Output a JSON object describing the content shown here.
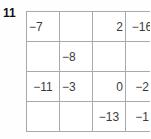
{
  "problem": {
    "number": "11"
  },
  "colors": {
    "grid_line": "#a9a9a9",
    "cell_text": "#3b3b3b",
    "label_text": "#111111",
    "background": "#fefefe"
  },
  "grid": {
    "rows": 4,
    "cols": 4,
    "cells": [
      [
        {
          "value": "−7",
          "align": "left",
          "blank": false
        },
        {
          "value": "",
          "align": "left",
          "blank": true
        },
        {
          "value": "2",
          "align": "right",
          "blank": false
        },
        {
          "value": "−16",
          "align": "center",
          "blank": false
        }
      ],
      [
        {
          "value": "",
          "align": "left",
          "blank": true
        },
        {
          "value": "−8",
          "align": "left",
          "blank": false
        },
        {
          "value": "",
          "align": "left",
          "blank": true
        },
        {
          "value": "",
          "align": "left",
          "blank": true
        }
      ],
      [
        {
          "value": "−11",
          "align": "center",
          "blank": false
        },
        {
          "value": "−3",
          "align": "left",
          "blank": false
        },
        {
          "value": "0",
          "align": "right",
          "blank": false
        },
        {
          "value": "−2",
          "align": "center",
          "blank": false
        }
      ],
      [
        {
          "value": "",
          "align": "left",
          "blank": true
        },
        {
          "value": "",
          "align": "left",
          "blank": true
        },
        {
          "value": "−13",
          "align": "center",
          "blank": false
        },
        {
          "value": "−1",
          "align": "center",
          "blank": false
        }
      ]
    ]
  }
}
